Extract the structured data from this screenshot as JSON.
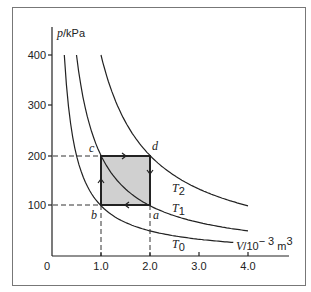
{
  "chart_data": {
    "type": "line",
    "title": "",
    "xlabel": "V/10^-3 m^3",
    "ylabel": "p/kPa",
    "xlim": [
      0,
      4.7
    ],
    "ylim": [
      0,
      450
    ],
    "x_ticks": [
      "0",
      "1.0",
      "2.0",
      "3.0",
      "4.0"
    ],
    "y_ticks": [
      "100",
      "200",
      "300",
      "400"
    ],
    "series": [
      {
        "name": "T0",
        "pV_const": 100,
        "x": [
          0.25,
          0.5,
          1.0,
          2.0,
          3.0,
          3.7
        ],
        "values": [
          400,
          200,
          100,
          50,
          33.3,
          27
        ]
      },
      {
        "name": "T1",
        "pV_const": 200,
        "x": [
          0.5,
          1.0,
          2.0,
          3.0,
          4.0
        ],
        "values": [
          400,
          200,
          100,
          66.7,
          50
        ]
      },
      {
        "name": "T2",
        "pV_const": 400,
        "x": [
          1.0,
          2.0,
          3.0,
          4.0
        ],
        "values": [
          400,
          200,
          133.3,
          100
        ]
      }
    ],
    "cycle": {
      "points": [
        {
          "label": "a",
          "V": 2.0,
          "p": 100
        },
        {
          "label": "b",
          "V": 1.0,
          "p": 100
        },
        {
          "label": "c",
          "V": 1.0,
          "p": 200
        },
        {
          "label": "d",
          "V": 2.0,
          "p": 200
        }
      ],
      "direction": "a→b→c→d→a",
      "fill": "#d0d0d0"
    },
    "grid": false,
    "legend": "curve labels T0, T1, T2 placed near curves"
  },
  "labels": {
    "ylabel_p": "p",
    "ylabel_unit": "/kPa",
    "xlabel_v": "V",
    "xlabel_unit": "/10",
    "xlabel_exp": "− 3",
    "xlabel_m": " m",
    "xlabel_m_exp": "3",
    "origin": "0",
    "T0": "T",
    "T0_sub": "0",
    "T1": "T",
    "T1_sub": "1",
    "T2": "T",
    "T2_sub": "2",
    "a": "a",
    "b": "b",
    "c": "c",
    "d": "d"
  },
  "colors": {
    "line": "#222222",
    "fill": "#d0d0d0",
    "frame": "#777777"
  }
}
